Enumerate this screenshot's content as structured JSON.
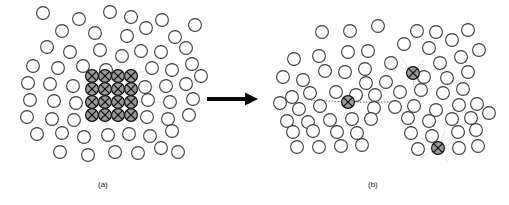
{
  "figure": {
    "panels": [
      {
        "id": "a",
        "caption": "(a)",
        "caption_x": 98,
        "caption_y": 180
      },
      {
        "id": "b",
        "caption": "(b)",
        "caption_x": 368,
        "caption_y": 180
      }
    ],
    "arrow": {
      "name": "transformation-arrow",
      "x1": 207,
      "y1": 99,
      "x2": 258,
      "y2": 99,
      "shaft_width": 4,
      "head_length": 13,
      "head_width": 13,
      "color": "#000000"
    }
  },
  "style": {
    "node_radius": 6.4,
    "node_stroke": "#3c3c3c",
    "node_stroke_width": 1.1,
    "node_fill": "#ffffff",
    "marked_fill": "#9a9a9a",
    "marked_stroke": "#111111",
    "marked_cross_color": "#111111",
    "link_color": "#9e9e9e",
    "link_width": 0.6,
    "dotted_link_color": "#5a5a5a",
    "caption_color": "#1a1a1a"
  },
  "chart_data": {
    "type": "scatter",
    "xlabel": "",
    "ylabel": "",
    "legend": [],
    "panels": [
      {
        "id": "a",
        "caption": "(a)",
        "description": "Scattered field of plain circular nodes with a contiguous 4x4 block of shaded crossed nodes at the center",
        "plain_nodes": [
          [
            43,
            13
          ],
          [
            79,
            19
          ],
          [
            110,
            12
          ],
          [
            131,
            17
          ],
          [
            162,
            20
          ],
          [
            62,
            31
          ],
          [
            95,
            33
          ],
          [
            127,
            36
          ],
          [
            146,
            28
          ],
          [
            175,
            37
          ],
          [
            195,
            25
          ],
          [
            47,
            47
          ],
          [
            70,
            52
          ],
          [
            100,
            50
          ],
          [
            122,
            56
          ],
          [
            141,
            51
          ],
          [
            161,
            52
          ],
          [
            186,
            48
          ],
          [
            33,
            66
          ],
          [
            58,
            68
          ],
          [
            83,
            66
          ],
          [
            106,
            70
          ],
          [
            152,
            68
          ],
          [
            172,
            70
          ],
          [
            192,
            64
          ],
          [
            28,
            83
          ],
          [
            50,
            84
          ],
          [
            73,
            86
          ],
          [
            145,
            87
          ],
          [
            166,
            86
          ],
          [
            186,
            84
          ],
          [
            201,
            76
          ],
          [
            30,
            100
          ],
          [
            54,
            101
          ],
          [
            76,
            103
          ],
          [
            148,
            100
          ],
          [
            170,
            102
          ],
          [
            193,
            99
          ],
          [
            27,
            117
          ],
          [
            52,
            119
          ],
          [
            74,
            120
          ],
          [
            147,
            117
          ],
          [
            168,
            119
          ],
          [
            189,
            115
          ],
          [
            37,
            134
          ],
          [
            62,
            133
          ],
          [
            84,
            137
          ],
          [
            108,
            135
          ],
          [
            129,
            134
          ],
          [
            150,
            136
          ],
          [
            172,
            131
          ],
          [
            60,
            152
          ],
          [
            88,
            155
          ],
          [
            115,
            152
          ],
          [
            138,
            153
          ],
          [
            161,
            148
          ],
          [
            178,
            152
          ]
        ],
        "marked_nodes": [
          [
            92,
            76
          ],
          [
            105,
            76
          ],
          [
            118,
            76
          ],
          [
            131,
            76
          ],
          [
            92,
            89
          ],
          [
            105,
            89
          ],
          [
            118,
            89
          ],
          [
            131,
            89
          ],
          [
            92,
            102
          ],
          [
            105,
            102
          ],
          [
            118,
            102
          ],
          [
            131,
            102
          ],
          [
            92,
            115
          ],
          [
            105,
            115
          ],
          [
            118,
            115
          ],
          [
            131,
            115
          ]
        ],
        "marked_grid": {
          "rows": 4,
          "cols": 4,
          "spacing": 13,
          "origin_x": 92,
          "origin_y": 76
        },
        "links": [
          [
            92,
            76,
            76,
            60
          ],
          [
            105,
            76,
            100,
            50
          ],
          [
            118,
            76,
            122,
            56
          ],
          [
            131,
            76,
            141,
            51
          ],
          [
            131,
            76,
            152,
            68
          ],
          [
            131,
            89,
            152,
            68
          ],
          [
            131,
            89,
            166,
            86
          ],
          [
            131,
            102,
            148,
            100
          ],
          [
            131,
            102,
            170,
            102
          ],
          [
            131,
            115,
            147,
            117
          ],
          [
            131,
            115,
            150,
            136
          ],
          [
            118,
            115,
            129,
            134
          ],
          [
            105,
            115,
            108,
            135
          ],
          [
            92,
            115,
            84,
            137
          ],
          [
            92,
            102,
            76,
            103
          ],
          [
            92,
            89,
            83,
            66
          ]
        ]
      },
      {
        "id": "b",
        "caption": "(b)",
        "description": "Redistributed field of plain circular nodes with three isolated shaded crossed nodes, each linked by dotted lines to nearby neighbors",
        "plain_nodes": [
          [
            322,
            32
          ],
          [
            350,
            31
          ],
          [
            378,
            26
          ],
          [
            417,
            31
          ],
          [
            436,
            32
          ],
          [
            294,
            59
          ],
          [
            319,
            56
          ],
          [
            348,
            52
          ],
          [
            368,
            51
          ],
          [
            404,
            44
          ],
          [
            429,
            48
          ],
          [
            452,
            40
          ],
          [
            468,
            30
          ],
          [
            325,
            71
          ],
          [
            345,
            72
          ],
          [
            365,
            69
          ],
          [
            391,
            63
          ],
          [
            440,
            63
          ],
          [
            461,
            57
          ],
          [
            479,
            50
          ],
          [
            303,
            80
          ],
          [
            283,
            77
          ],
          [
            366,
            83
          ],
          [
            386,
            82
          ],
          [
            424,
            77
          ],
          [
            447,
            78
          ],
          [
            468,
            72
          ],
          [
            292,
            97
          ],
          [
            310,
            93
          ],
          [
            336,
            92
          ],
          [
            356,
            95
          ],
          [
            375,
            95
          ],
          [
            400,
            92
          ],
          [
            421,
            90
          ],
          [
            443,
            93
          ],
          [
            463,
            89
          ],
          [
            280,
            103
          ],
          [
            299,
            109
          ],
          [
            320,
            106
          ],
          [
            374,
            108
          ],
          [
            395,
            107
          ],
          [
            414,
            106
          ],
          [
            436,
            110
          ],
          [
            459,
            105
          ],
          [
            477,
            104
          ],
          [
            287,
            121
          ],
          [
            308,
            122
          ],
          [
            330,
            120
          ],
          [
            352,
            119
          ],
          [
            371,
            119
          ],
          [
            408,
            118
          ],
          [
            429,
            121
          ],
          [
            452,
            119
          ],
          [
            471,
            118
          ],
          [
            489,
            113
          ],
          [
            293,
            132
          ],
          [
            313,
            131
          ],
          [
            337,
            132
          ],
          [
            357,
            133
          ],
          [
            411,
            133
          ],
          [
            432,
            136
          ],
          [
            458,
            132
          ],
          [
            476,
            130
          ],
          [
            297,
            147
          ],
          [
            319,
            147
          ],
          [
            341,
            146
          ],
          [
            362,
            145
          ],
          [
            418,
            149
          ],
          [
            459,
            148
          ],
          [
            478,
            146
          ]
        ],
        "marked_nodes": [
          [
            348,
            102
          ],
          [
            413,
            73
          ],
          [
            438,
            148
          ]
        ],
        "links": [
          [
            348,
            102,
            308,
            100
          ],
          [
            348,
            102,
            330,
            101
          ],
          [
            348,
            102,
            383,
            103
          ],
          [
            348,
            102,
            396,
            102
          ],
          [
            348,
            102,
            336,
            92
          ],
          [
            348,
            102,
            356,
            95
          ],
          [
            348,
            102,
            343,
            120
          ],
          [
            348,
            102,
            352,
            119
          ],
          [
            413,
            73,
            391,
            63
          ],
          [
            413,
            73,
            400,
            56
          ],
          [
            413,
            73,
            424,
            60
          ],
          [
            413,
            73,
            414,
            90
          ],
          [
            413,
            73,
            400,
            88
          ],
          [
            413,
            73,
            429,
            87
          ],
          [
            438,
            148,
            420,
            137
          ],
          [
            438,
            148,
            445,
            131
          ],
          [
            438,
            148,
            420,
            158
          ],
          [
            438,
            148,
            448,
            162
          ],
          [
            438,
            148,
            458,
            141
          ],
          [
            438,
            148,
            415,
            150
          ],
          [
            438,
            148,
            461,
            150
          ]
        ],
        "dotted_links": [
          [
            348,
            102,
            308,
            100
          ],
          [
            348,
            102,
            396,
            102
          ]
        ]
      }
    ]
  }
}
